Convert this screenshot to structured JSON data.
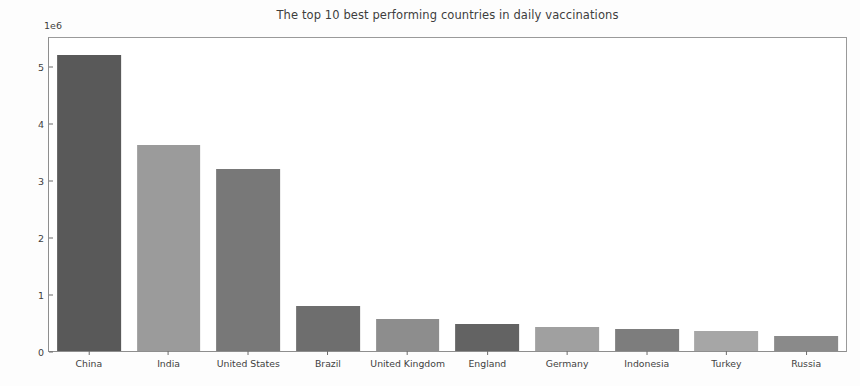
{
  "chart_data": {
    "type": "bar",
    "title": "The top 10 best performing countries in daily vaccinations",
    "xlabel": "",
    "ylabel": "Number of daily vaccinations (in millions)",
    "y_offset_text": "1e6",
    "categories": [
      "China",
      "India",
      "United States",
      "Brazil",
      "United Kingdom",
      "England",
      "Germany",
      "Indonesia",
      "Turkey",
      "Russia"
    ],
    "values": [
      5200000,
      3620000,
      3200000,
      790000,
      570000,
      480000,
      430000,
      390000,
      360000,
      270000
    ],
    "bar_colors": [
      "#595959",
      "#9b9b9b",
      "#787878",
      "#6e6e6e",
      "#8d8d8d",
      "#636363",
      "#a0a0a0",
      "#7d7d7d",
      "#a6a6a6",
      "#8a8a8a"
    ],
    "ylim": [
      0,
      5500000
    ],
    "yticks": [
      0,
      1000000,
      2000000,
      3000000,
      4000000,
      5000000
    ],
    "ytick_labels": [
      "0",
      "1",
      "2",
      "3",
      "4",
      "5"
    ],
    "grid": false,
    "legend": null,
    "bar_width_ratio": 0.8
  }
}
